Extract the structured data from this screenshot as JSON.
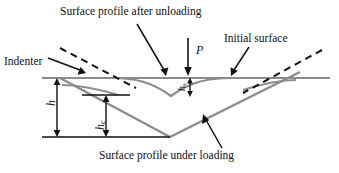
{
  "figure": {
    "type": "nanoindentation-cross-section-schematic",
    "annotations": {
      "surface_after_unloading": "Surface profile after unloading",
      "initial_surface": "Initial surface",
      "indenter": "Indenter",
      "surface_under_loading": "Surface profile under loading"
    },
    "symbols": {
      "load": "P",
      "total_depth": "h",
      "contact_depth_base": "h",
      "contact_depth_sub": "c",
      "sink_in_base": "h",
      "sink_in_sub": "s"
    },
    "colors": {
      "surface_gray": "#8c8c8c",
      "indenter_black": "#111111",
      "text_black": "#111111",
      "background": "#ffffff"
    }
  }
}
